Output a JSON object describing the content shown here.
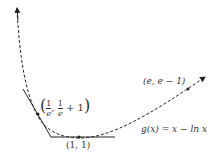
{
  "diagram": {
    "function_label": "g(x) = x − ln x",
    "points": [
      {
        "id": "p1",
        "label": "(1/e, 1/e + 1)",
        "frac_num": "1",
        "frac_den": "e",
        "tail": "+ 1"
      },
      {
        "id": "p2",
        "label": "(1, 1)"
      },
      {
        "id": "p3",
        "label": "(e, e − 1)"
      }
    ],
    "curve_style": "dashed with arrowheads",
    "tangent_lines": [
      "tangent at (1/e, 1/e + 1)",
      "tangent at (1, 1)"
    ],
    "colors": {
      "stroke": "#222222",
      "background": "#ffffff"
    }
  }
}
